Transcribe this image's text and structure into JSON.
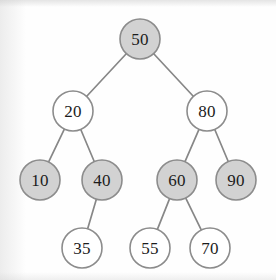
{
  "diagram": {
    "type": "binary-search-tree",
    "canvas": {
      "width": 276,
      "height": 280
    },
    "colors": {
      "background": "#fefefe",
      "node_fill_shaded": "#d2d2d2",
      "node_fill_hollow": "#ffffff",
      "node_stroke": "#8c8c8c",
      "edge_stroke": "#878787",
      "label_text": "#1c1c1c"
    },
    "nodes": [
      {
        "id": "n50",
        "label": "50",
        "value": 50,
        "cx": 140,
        "cy": 39,
        "r": 20,
        "fill": "shaded",
        "level": 0
      },
      {
        "id": "n20",
        "label": "20",
        "value": 20,
        "cx": 73,
        "cy": 111,
        "r": 20,
        "fill": "hollow",
        "level": 1
      },
      {
        "id": "n80",
        "label": "80",
        "value": 80,
        "cx": 207,
        "cy": 111,
        "r": 20,
        "fill": "hollow",
        "level": 1
      },
      {
        "id": "n10",
        "label": "10",
        "value": 10,
        "cx": 40,
        "cy": 180,
        "r": 20,
        "fill": "shaded",
        "level": 2
      },
      {
        "id": "n40",
        "label": "40",
        "value": 40,
        "cx": 102,
        "cy": 180,
        "r": 20,
        "fill": "shaded",
        "level": 2
      },
      {
        "id": "n60",
        "label": "60",
        "value": 60,
        "cx": 177,
        "cy": 180,
        "r": 20,
        "fill": "shaded",
        "level": 2
      },
      {
        "id": "n90",
        "label": "90",
        "value": 90,
        "cx": 236,
        "cy": 180,
        "r": 20,
        "fill": "shaded",
        "level": 2
      },
      {
        "id": "n35",
        "label": "35",
        "value": 35,
        "cx": 82,
        "cy": 248,
        "r": 20,
        "fill": "hollow",
        "level": 3
      },
      {
        "id": "n55",
        "label": "55",
        "value": 55,
        "cx": 150,
        "cy": 248,
        "r": 20,
        "fill": "hollow",
        "level": 3
      },
      {
        "id": "n70",
        "label": "70",
        "value": 70,
        "cx": 210,
        "cy": 248,
        "r": 20,
        "fill": "hollow",
        "level": 3
      }
    ],
    "edges": [
      {
        "id": "e50-20",
        "from": "n50",
        "to": "n20",
        "side": "left"
      },
      {
        "id": "e50-80",
        "from": "n50",
        "to": "n80",
        "side": "right"
      },
      {
        "id": "e20-10",
        "from": "n20",
        "to": "n10",
        "side": "left"
      },
      {
        "id": "e20-40",
        "from": "n20",
        "to": "n40",
        "side": "right"
      },
      {
        "id": "e80-60",
        "from": "n80",
        "to": "n60",
        "side": "left"
      },
      {
        "id": "e80-90",
        "from": "n80",
        "to": "n90",
        "side": "right"
      },
      {
        "id": "e40-35",
        "from": "n40",
        "to": "n35",
        "side": "right"
      },
      {
        "id": "e60-55",
        "from": "n60",
        "to": "n55",
        "side": "left"
      },
      {
        "id": "e60-70",
        "from": "n60",
        "to": "n70",
        "side": "right"
      }
    ]
  }
}
